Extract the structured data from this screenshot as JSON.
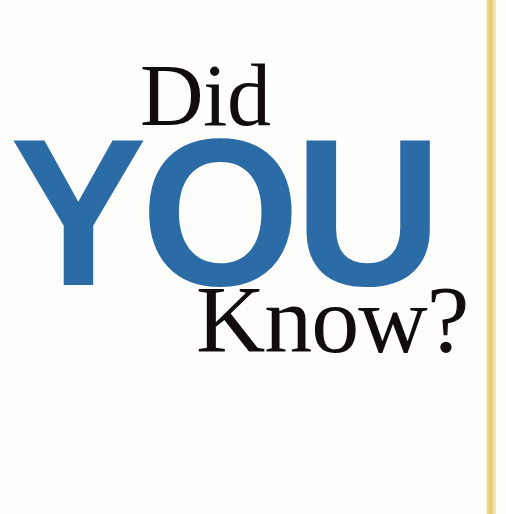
{
  "page": {
    "kind": "print-page-scan",
    "background_color": "#fdfdfb",
    "width": 506,
    "height": 514
  },
  "headline": {
    "full_text": "Did YOU Know?",
    "lines": [
      {
        "id": "did",
        "text": "Did",
        "style": "serif-regular",
        "color": "#100d0c"
      },
      {
        "id": "you",
        "text": "YOU",
        "style": "sans-bold",
        "color": "#2b6ca6"
      },
      {
        "id": "know",
        "text": "Know?",
        "style": "serif-regular",
        "color": "#100d0c"
      }
    ]
  },
  "decoration": {
    "vertical_rule": {
      "name": "gold-vertical-rule",
      "color": "#ecd792",
      "accent_color": "#e3c86f"
    }
  }
}
